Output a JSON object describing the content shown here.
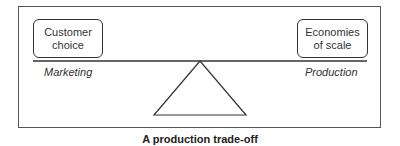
{
  "diagram": {
    "left_box": {
      "line1": "Customer",
      "line2": "choice"
    },
    "right_box": {
      "line1": "Economies",
      "line2": "of scale"
    },
    "left_label": "Marketing",
    "right_label": "Production",
    "caption": "A production trade-off",
    "colors": {
      "stroke": "#333333",
      "frame": "#555555",
      "background": "#ffffff"
    }
  }
}
